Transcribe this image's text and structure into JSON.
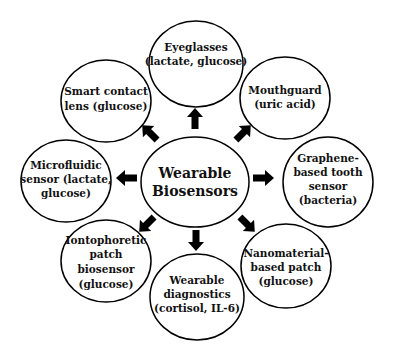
{
  "diagram": {
    "center": {
      "lines": [
        "Wearable",
        "Biosensors"
      ]
    },
    "nodes": [
      {
        "id": "eyeglasses",
        "lines": [
          "Eyeglasses",
          "(lactate, glucose)"
        ]
      },
      {
        "id": "mouthguard",
        "lines": [
          "Mouthguard",
          "(uric  acid)"
        ]
      },
      {
        "id": "graphene",
        "lines": [
          "Graphene-",
          "based tooth",
          "sensor",
          "(bacteria)"
        ]
      },
      {
        "id": "nanomaterial",
        "lines": [
          "Nanomaterial-",
          "based patch",
          "(glucose)"
        ]
      },
      {
        "id": "diagnostics",
        "lines": [
          "Wearable",
          "diagnostics",
          "(cortisol, IL-6)"
        ]
      },
      {
        "id": "iontophoretic",
        "lines": [
          "Iontophoretic",
          "patch",
          "biosensor",
          "(glucose)"
        ]
      },
      {
        "id": "microfluidic",
        "lines": [
          "Microfluidic",
          "sensor (lactate,",
          "glucose)"
        ]
      },
      {
        "id": "contact-lens",
        "lines": [
          "Smart  contact",
          "lens (glucose)"
        ]
      }
    ],
    "edges": [
      {
        "from": "center",
        "to": "eyeglasses",
        "direction": "up"
      },
      {
        "from": "center",
        "to": "mouthguard",
        "direction": "up-right"
      },
      {
        "from": "center",
        "to": "graphene",
        "direction": "right"
      },
      {
        "from": "center",
        "to": "nanomaterial",
        "direction": "down-right"
      },
      {
        "from": "center",
        "to": "diagnostics",
        "direction": "down"
      },
      {
        "from": "center",
        "to": "iontophoretic",
        "direction": "down-left"
      },
      {
        "from": "center",
        "to": "microfluidic",
        "direction": "left"
      },
      {
        "from": "center",
        "to": "contact-lens",
        "direction": "up-left"
      }
    ],
    "colors": {
      "stroke": "#000000",
      "fill": "#ffffff",
      "text": "#111111"
    }
  }
}
